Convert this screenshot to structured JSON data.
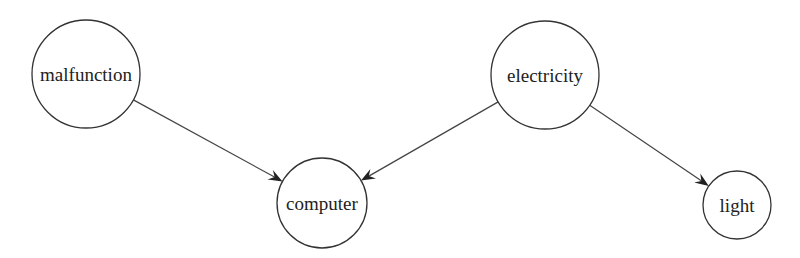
{
  "diagram": {
    "type": "directed-graph",
    "nodes": [
      {
        "id": "malfunction",
        "label": "malfunction",
        "cx": 86,
        "cy": 74,
        "r": 54
      },
      {
        "id": "computer",
        "label": "computer",
        "cx": 322,
        "cy": 203,
        "r": 45
      },
      {
        "id": "electricity",
        "label": "electricity",
        "cx": 545,
        "cy": 75,
        "r": 54
      },
      {
        "id": "light",
        "label": "light",
        "cx": 737,
        "cy": 205,
        "r": 34
      }
    ],
    "edges": [
      {
        "from": "malfunction",
        "to": "computer"
      },
      {
        "from": "electricity",
        "to": "computer"
      },
      {
        "from": "electricity",
        "to": "light"
      }
    ],
    "colors": {
      "stroke": "#333333",
      "text": "#222222",
      "background": "#ffffff"
    }
  }
}
